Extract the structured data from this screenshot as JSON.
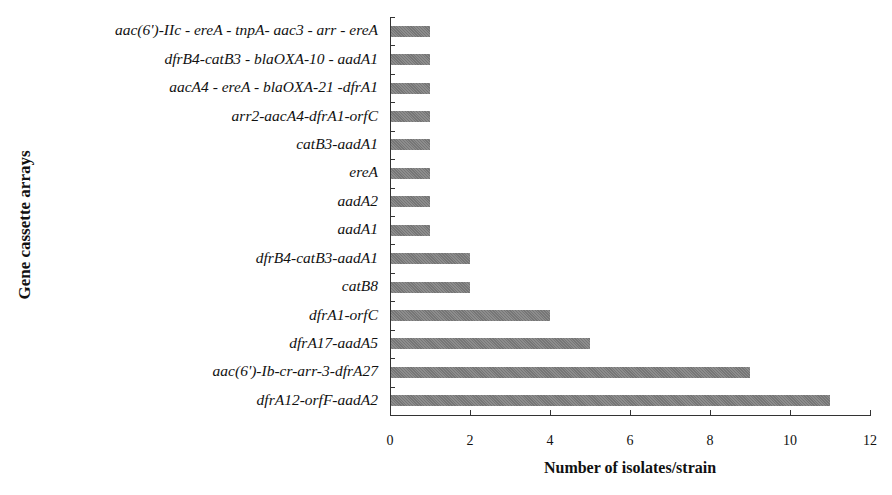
{
  "chart_data": {
    "type": "bar",
    "orientation": "horizontal",
    "title": "",
    "xlabel": "Number of isolates/strain",
    "ylabel": "Gene cassette arrays",
    "xlim": [
      0,
      12
    ],
    "x_ticks": [
      "0",
      "2",
      "4",
      "6",
      "8",
      "10",
      "12"
    ],
    "grid": false,
    "legend": null,
    "bar_color": "#7d7d7d",
    "categories": [
      "aac(6')-IIc - ereA - tnpA- aac3 - arr - ereA",
      "dfrB4-catB3 - blaOXA-10 - aadA1",
      "aacA4 - ereA - blaOXA-21 -dfrA1",
      "arr2-aacA4-dfrA1-orfC",
      "catB3-aadA1",
      "ereA",
      "aadA2",
      "aadA1",
      "dfrB4-catB3-aadA1",
      "catB8",
      "dfrA1-orfC",
      "dfrA17-aadA5",
      "aac(6')-Ib-cr-arr-3-dfrA27",
      "dfrA12-orfF-aadA2"
    ],
    "values": [
      1,
      1,
      1,
      1,
      1,
      1,
      1,
      1,
      2,
      2,
      4,
      5,
      9,
      11
    ]
  }
}
